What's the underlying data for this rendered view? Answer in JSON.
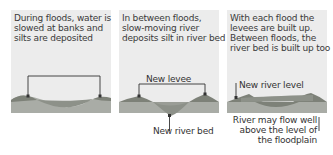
{
  "panels": [
    {
      "caption": "During floods, water is slowed at banks and silts are deposited"
    },
    {
      "caption": "In between floods, slow-moving river deposits silt in river bed",
      "labels": {
        "levee": "New levee",
        "river_bed": "New river bed"
      }
    },
    {
      "caption": "With each flood the levees are built up. Between floods, the river bed is built up too",
      "labels": {
        "river_level": "New river level",
        "flow_above": "River may flow well above the level of the floodplain"
      }
    }
  ],
  "colors": {
    "panel_bg": "#ececec",
    "ground": "#a9aca6",
    "levee": "#7d8178",
    "river": "#8d9189",
    "line": "#333333"
  }
}
